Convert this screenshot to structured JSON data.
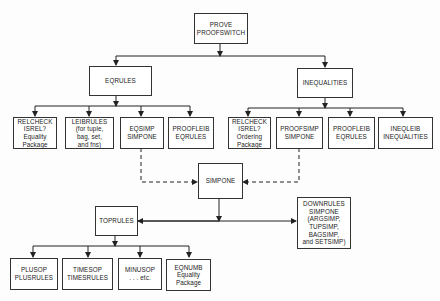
{
  "diagram": {
    "nodes": {
      "root": "PROVE\nPROOFSWITCH",
      "eqrules": "EQRULES",
      "inequalities": "INEQUALITIES",
      "eq_relcheck": "RELCHECK\nISREL?\nEquality\nPackage",
      "eq_leibrules": "LEIBRULES\n(for tuple,\nbag, set,\nand fns)",
      "eq_eqsimp": "EQSIMP\nSIMPONE",
      "eq_proofleib": "PROOFLEIB\nEQRULES",
      "ineq_relcheck": "RELCHECK\nISREL?\nOrdering\nPackage",
      "ineq_proofsimp": "PROOFSIMP\nSIMPONE",
      "ineq_proofleib": "PROOFLEIB\nEQRULES",
      "ineq_ineqleib": "INEQLEIB\nINEQUALITIES",
      "simpone": "SIMPONE",
      "toprules": "TOPRULES",
      "downrules": "DOWNRULES\nSIMPONE\n(ARGSIMP,\nTUPSIMP,\nBAGSIMP,\nand SETSIMP)",
      "plusop": "PLUSOP\nPLUSRULES",
      "timesop": "TIMESOP\nTIMESRULES",
      "minusop": "MINUSOP\n. . . etc.",
      "eqnumb": "EQNUMB\nEquality\nPackage"
    },
    "edges": [
      {
        "from": "root",
        "to": "eqrules",
        "style": "solid"
      },
      {
        "from": "root",
        "to": "inequalities",
        "style": "solid"
      },
      {
        "from": "eqrules",
        "to": "eq_relcheck",
        "style": "solid"
      },
      {
        "from": "eqrules",
        "to": "eq_leibrules",
        "style": "solid"
      },
      {
        "from": "eqrules",
        "to": "eq_eqsimp",
        "style": "solid"
      },
      {
        "from": "eqrules",
        "to": "eq_proofleib",
        "style": "solid"
      },
      {
        "from": "inequalities",
        "to": "ineq_relcheck",
        "style": "solid"
      },
      {
        "from": "inequalities",
        "to": "ineq_proofsimp",
        "style": "solid"
      },
      {
        "from": "inequalities",
        "to": "ineq_proofleib",
        "style": "solid"
      },
      {
        "from": "inequalities",
        "to": "ineq_ineqleib",
        "style": "solid"
      },
      {
        "from": "eq_eqsimp",
        "to": "simpone",
        "style": "dashed"
      },
      {
        "from": "ineq_proofsimp",
        "to": "simpone",
        "style": "dashed"
      },
      {
        "from": "simpone",
        "to": "toprules",
        "style": "solid"
      },
      {
        "from": "simpone",
        "to": "downrules",
        "style": "solid"
      },
      {
        "from": "toprules",
        "to": "plusop",
        "style": "solid"
      },
      {
        "from": "toprules",
        "to": "timesop",
        "style": "solid"
      },
      {
        "from": "toprules",
        "to": "minusop",
        "style": "solid"
      },
      {
        "from": "toprules",
        "to": "eqnumb",
        "style": "solid"
      }
    ]
  }
}
